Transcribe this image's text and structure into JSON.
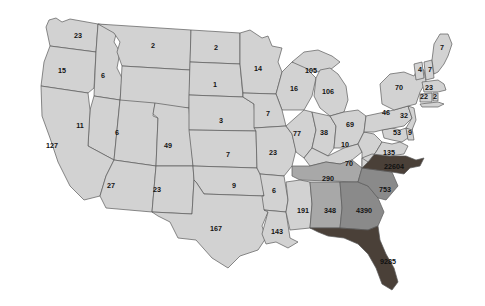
{
  "figure": {
    "type": "choropleth-map",
    "region": "United States",
    "background": "#ffffff",
    "border_color": "#5a5a5a"
  },
  "legend_scale": {
    "bins": [
      {
        "name": "low",
        "fill": "#d2d2d2"
      },
      {
        "name": "medium",
        "fill": "#a8a8a8"
      },
      {
        "name": "high",
        "fill": "#8a8a8a"
      },
      {
        "name": "very-high",
        "fill": "#4a4038"
      }
    ]
  },
  "chart_data": {
    "type": "map",
    "title": "",
    "xlabel": "",
    "ylabel": "",
    "value_range": [
      1,
      22604
    ],
    "categories": [
      "WA",
      "OR",
      "ID",
      "MT",
      "ND",
      "SD",
      "NE",
      "KS",
      "OK",
      "TX",
      "MN",
      "WI",
      "IA",
      "MO",
      "AR",
      "LA",
      "MI-UP",
      "MI-LP",
      "IL",
      "IN",
      "OH",
      "KY",
      "TN",
      "MS",
      "AL",
      "GA",
      "FL",
      "SC",
      "NC",
      "VA",
      "WV",
      "MD",
      "DE",
      "NJ",
      "PA",
      "NY",
      "CT",
      "RI",
      "MA",
      "VT",
      "NH",
      "ME",
      "CA",
      "NV",
      "UT",
      "CO",
      "AZ",
      "NM"
    ],
    "values": [
      23,
      15,
      6,
      2,
      2,
      1,
      3,
      7,
      9,
      167,
      14,
      16,
      7,
      23,
      6,
      143,
      105,
      106,
      77,
      38,
      69,
      10,
      290,
      191,
      348,
      4390,
      9285,
      753,
      22604,
      135,
      53,
      9,
      9,
      32,
      46,
      70,
      22,
      2,
      23,
      4,
      7,
      7,
      127,
      11,
      6,
      49,
      27,
      23
    ]
  },
  "states": [
    {
      "id": "WA",
      "name": "Washington",
      "value": "23",
      "bin": "low",
      "lx": 78,
      "ly": 36
    },
    {
      "id": "OR",
      "name": "Oregon",
      "value": "15",
      "bin": "low",
      "lx": 62,
      "ly": 71
    },
    {
      "id": "ID",
      "name": "Idaho",
      "value": "6",
      "bin": "low",
      "lx": 103,
      "ly": 76
    },
    {
      "id": "MT",
      "name": "Montana",
      "value": "2",
      "bin": "low",
      "lx": 153,
      "ly": 46
    },
    {
      "id": "ND",
      "name": "North Dakota",
      "value": "2",
      "bin": "low",
      "lx": 216,
      "ly": 48
    },
    {
      "id": "SD",
      "name": "South Dakota",
      "value": "1",
      "bin": "low",
      "lx": 215,
      "ly": 85
    },
    {
      "id": "NE",
      "name": "Nebraska",
      "value": "3",
      "bin": "low",
      "lx": 221,
      "ly": 121
    },
    {
      "id": "KS",
      "name": "Kansas",
      "value": "7",
      "bin": "low",
      "lx": 228,
      "ly": 155
    },
    {
      "id": "OK",
      "name": "Oklahoma",
      "value": "9",
      "bin": "low",
      "lx": 234,
      "ly": 186
    },
    {
      "id": "TX",
      "name": "Texas",
      "value": "167",
      "bin": "low",
      "lx": 216,
      "ly": 229
    },
    {
      "id": "MN",
      "name": "Minnesota",
      "value": "14",
      "bin": "low",
      "lx": 258,
      "ly": 69
    },
    {
      "id": "WI",
      "name": "Wisconsin",
      "value": "16",
      "bin": "low",
      "lx": 294,
      "ly": 89
    },
    {
      "id": "IA",
      "name": "Iowa",
      "value": "7",
      "bin": "low",
      "lx": 268,
      "ly": 114
    },
    {
      "id": "MO",
      "name": "Missouri",
      "value": "23",
      "bin": "low",
      "lx": 273,
      "ly": 153
    },
    {
      "id": "AR",
      "name": "Arkansas",
      "value": "6",
      "bin": "low",
      "lx": 274,
      "ly": 191
    },
    {
      "id": "LA",
      "name": "Louisiana",
      "value": "143",
      "bin": "low",
      "lx": 277,
      "ly": 232
    },
    {
      "id": "MIU",
      "name": "Michigan Upper Peninsula",
      "value": "105",
      "bin": "low",
      "lx": 311,
      "ly": 71
    },
    {
      "id": "MIL",
      "name": "Michigan Lower Peninsula",
      "value": "106",
      "bin": "low",
      "lx": 328,
      "ly": 92
    },
    {
      "id": "IL",
      "name": "Illinois",
      "value": "77",
      "bin": "low",
      "lx": 297,
      "ly": 134
    },
    {
      "id": "IN",
      "name": "Indiana",
      "value": "38",
      "bin": "low",
      "lx": 324,
      "ly": 133
    },
    {
      "id": "OH",
      "name": "Ohio",
      "value": "69",
      "bin": "low",
      "lx": 350,
      "ly": 125
    },
    {
      "id": "KY",
      "name": "Kentucky",
      "value": "10",
      "bin": "low",
      "lx": 345,
      "ly": 145
    },
    {
      "id": "TN",
      "name": "Tennessee",
      "value": "290",
      "bin": "medium",
      "lx": 328,
      "ly": 179
    },
    {
      "id": "MS",
      "name": "Mississippi",
      "value": "191",
      "bin": "low",
      "lx": 303,
      "ly": 211
    },
    {
      "id": "AL",
      "name": "Alabama",
      "value": "348",
      "bin": "medium",
      "lx": 330,
      "ly": 211
    },
    {
      "id": "GA",
      "name": "Georgia",
      "value": "4390",
      "bin": "high",
      "lx": 364,
      "ly": 211
    },
    {
      "id": "FL",
      "name": "Florida",
      "value": "9285",
      "bin": "very-high",
      "lx": 388,
      "ly": 262
    },
    {
      "id": "SC",
      "name": "South Carolina",
      "value": "753",
      "bin": "high",
      "lx": 385,
      "ly": 190
    },
    {
      "id": "NC",
      "name": "North Carolina",
      "value": "22604",
      "bin": "very-high",
      "lx": 394,
      "ly": 167
    },
    {
      "id": "VA",
      "name": "Virginia",
      "value": "135",
      "bin": "low",
      "lx": 389,
      "ly": 153
    },
    {
      "id": "WV",
      "name": "West Virginia",
      "value": "70",
      "bin": "low",
      "lx": 349,
      "ly": 164
    },
    {
      "id": "MD",
      "name": "Maryland",
      "value": "53",
      "bin": "low",
      "lx": 397,
      "ly": 133
    },
    {
      "id": "DE",
      "name": "Delaware",
      "value": "9",
      "bin": "low",
      "lx": 410,
      "ly": 133
    },
    {
      "id": "NJ",
      "name": "New Jersey",
      "value": "32",
      "bin": "low",
      "lx": 404,
      "ly": 116
    },
    {
      "id": "PA",
      "name": "Pennsylvania",
      "value": "46",
      "bin": "low",
      "lx": 386,
      "ly": 113
    },
    {
      "id": "NY",
      "name": "New York",
      "value": "70",
      "bin": "low",
      "lx": 399,
      "ly": 88
    },
    {
      "id": "CT",
      "name": "Connecticut",
      "value": "22",
      "bin": "low",
      "lx": 424,
      "ly": 97
    },
    {
      "id": "RI",
      "name": "Rhode Island",
      "value": "2",
      "bin": "low",
      "lx": 435,
      "ly": 97
    },
    {
      "id": "MA",
      "name": "Massachusetts",
      "value": "23",
      "bin": "low",
      "lx": 429,
      "ly": 88
    },
    {
      "id": "VT",
      "name": "Vermont",
      "value": "4",
      "bin": "low",
      "lx": 420,
      "ly": 70
    },
    {
      "id": "NH",
      "name": "New Hampshire",
      "value": "7",
      "bin": "low",
      "lx": 430,
      "ly": 70
    },
    {
      "id": "ME",
      "name": "Maine",
      "value": "7",
      "bin": "low",
      "lx": 442,
      "ly": 48
    },
    {
      "id": "CA",
      "name": "California",
      "value": "127",
      "bin": "low",
      "lx": 52,
      "ly": 146
    },
    {
      "id": "NV",
      "name": "Nevada",
      "value": "11",
      "bin": "low",
      "lx": 80,
      "ly": 126
    },
    {
      "id": "UT",
      "name": "Utah",
      "value": "6",
      "bin": "low",
      "lx": 117,
      "ly": 133
    },
    {
      "id": "CO",
      "name": "Colorado",
      "value": "49",
      "bin": "low",
      "lx": 168,
      "ly": 146
    },
    {
      "id": "AZ",
      "name": "Arizona",
      "value": "27",
      "bin": "low",
      "lx": 111,
      "ly": 186
    },
    {
      "id": "NM",
      "name": "New Mexico",
      "value": "23",
      "bin": "low",
      "lx": 157,
      "ly": 190
    }
  ]
}
